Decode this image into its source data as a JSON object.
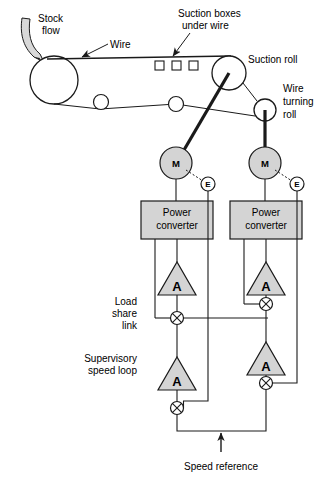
{
  "diagram": {
    "labels": {
      "stock_flow": [
        "Stock",
        "flow"
      ],
      "wire": "Wire",
      "suction_boxes": [
        "Suction boxes",
        "under wire"
      ],
      "suction_roll": "Suction roll",
      "wire_turning_roll": [
        "Wire",
        "turning",
        "roll"
      ],
      "load_share_link": [
        "Load",
        "share",
        "link"
      ],
      "supervisory_speed_loop": [
        "Supervisory",
        "speed loop"
      ],
      "speed_reference": "Speed reference"
    },
    "blocks": {
      "power_converter": [
        "Power",
        "converter"
      ],
      "motor_symbol": "M",
      "encoder_symbol": "E",
      "amplifier_symbol": "A"
    },
    "drives": [
      {
        "name": "suction-roll-drive",
        "motor": "M",
        "encoder": "E",
        "converter": [
          "Power",
          "converter"
        ],
        "current_amplifier": "A",
        "speed_amplifier": "A"
      },
      {
        "name": "wire-turning-roll-drive",
        "motor": "M",
        "encoder": "E",
        "converter": [
          "Power",
          "converter"
        ],
        "current_amplifier": "A",
        "speed_amplifier": "A"
      }
    ],
    "colors": {
      "line": "#1a1a1a",
      "fill_gray": "#d4d4d4",
      "fill_white": "#ffffff",
      "background": "#ffffff",
      "stock_pipe": "#d8d8d8"
    }
  }
}
